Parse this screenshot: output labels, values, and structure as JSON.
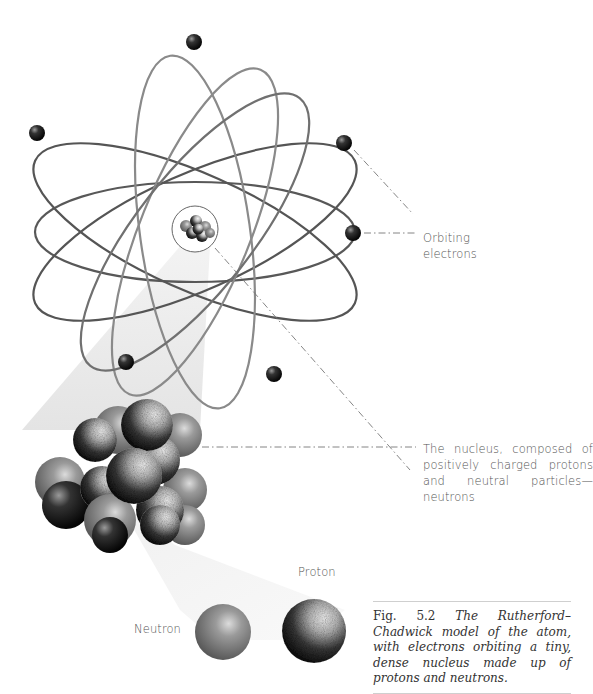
{
  "figure": {
    "number": "Fig. 5.2",
    "caption": "The Rutherford–Chadwick model of the atom, with electrons orbiting a tiny, dense nucleus made up of protons and neutrons.",
    "labels": {
      "electrons": "Orbiting electrons",
      "nucleus": "The nucleus, composed of positively charged protons and neutral particles—neutrons",
      "proton": "Proton",
      "neutron": "Neutron"
    },
    "atom": {
      "center": [
        195,
        232
      ],
      "orbit_count": 6,
      "electron_count": 7
    },
    "colors": {
      "orbit_dark": "#555555",
      "orbit_light": "#8a8a8a",
      "electron": "#1a1a1a",
      "leader_line": "#777777",
      "caption_rule": "#cfcfcf"
    }
  }
}
